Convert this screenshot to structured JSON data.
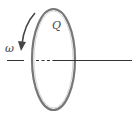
{
  "diagram": {
    "labels": {
      "charge": "Q",
      "angular_velocity": "ω"
    },
    "colors": {
      "ring": "#777777",
      "axis": "#333333",
      "arrow": "#444444",
      "background": "#ffffff"
    }
  }
}
